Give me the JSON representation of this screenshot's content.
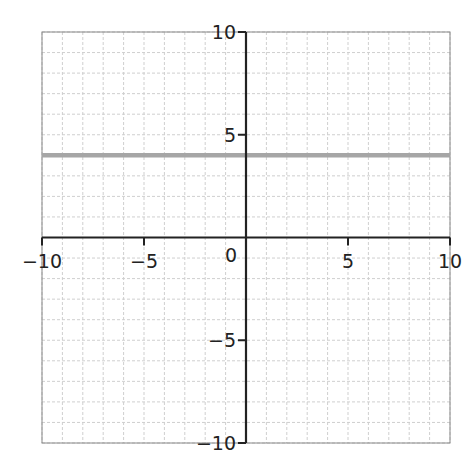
{
  "chart_data": {
    "type": "line",
    "title": "",
    "xlabel": "",
    "ylabel": "",
    "xlim": [
      -10,
      10
    ],
    "ylim": [
      -10,
      10
    ],
    "grid": true,
    "grid_step": 1,
    "x_ticks": [
      -10,
      -5,
      0,
      5,
      10
    ],
    "y_ticks": [
      -10,
      -5,
      5,
      10
    ],
    "x_tick_labels": [
      "−10",
      "−5",
      "0",
      "5",
      "10"
    ],
    "y_tick_labels": [
      "−10",
      "−5",
      "5",
      "10"
    ],
    "origin_label": "0",
    "series": [
      {
        "name": "y = 4",
        "equation": "y = 4",
        "x": [
          -10,
          10
        ],
        "y": [
          4,
          4
        ],
        "color": "#a6a6a6"
      }
    ],
    "legend": null
  },
  "colors": {
    "grid": "#cfcfcf",
    "axis": "#222222",
    "line": "#a6a6a6"
  }
}
